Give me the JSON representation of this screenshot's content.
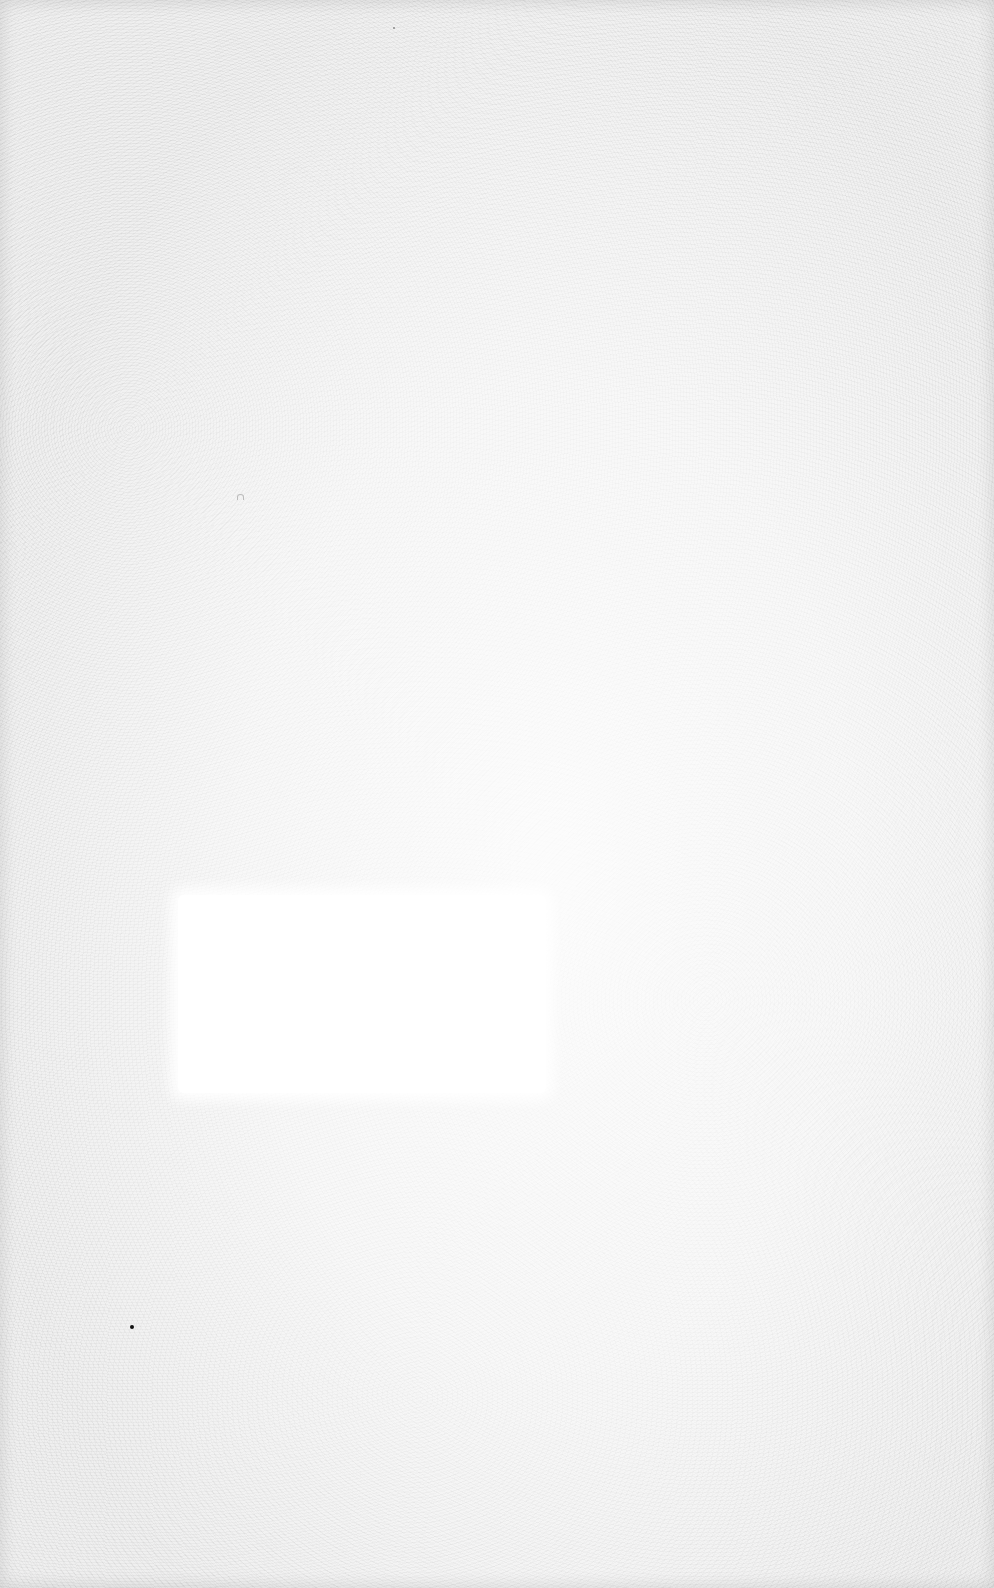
{
  "document": {
    "type": "scanned blank page",
    "text_content": "",
    "colors": {
      "paper": "#efefef",
      "blank_patch": "#ffffff",
      "speck": "#111111"
    }
  }
}
